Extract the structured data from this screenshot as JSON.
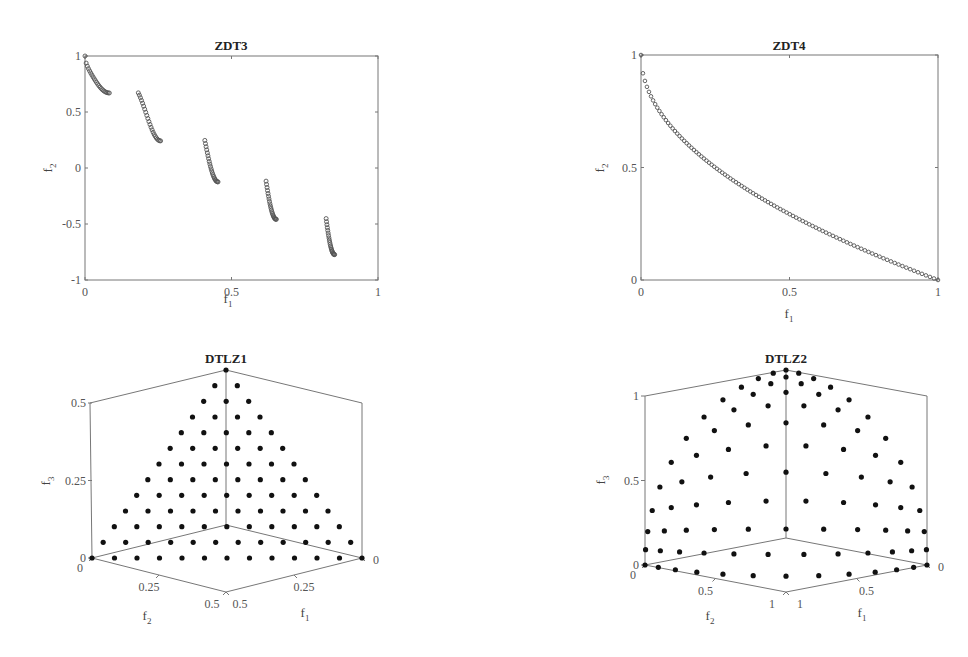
{
  "figure": {
    "width": 968,
    "height": 657,
    "marker_color": "#111111",
    "axis_color": "#777777"
  },
  "chart_data": [
    {
      "id": "zdt3",
      "type": "scatter",
      "title": "ZDT3",
      "xlabel": "f1",
      "ylabel": "f2",
      "xlim": [
        0,
        1
      ],
      "ylim": [
        -1,
        1
      ],
      "xticks": [
        "0",
        "0.5",
        "1"
      ],
      "yticks": [
        "-1",
        "-0.5",
        "0",
        "0.5",
        "1"
      ],
      "grid": false,
      "marker": "open-circle",
      "segments": [
        {
          "f1_range": [
            0.0,
            0.083
          ],
          "f2_range": [
            1.0,
            0.67
          ]
        },
        {
          "f1_range": [
            0.182,
            0.258
          ],
          "f2_range": [
            0.64,
            0.23
          ]
        },
        {
          "f1_range": [
            0.409,
            0.454
          ],
          "f2_range": [
            0.24,
            -0.13
          ]
        },
        {
          "f1_range": [
            0.618,
            0.653
          ],
          "f2_range": [
            -0.15,
            -0.46
          ]
        },
        {
          "f1_range": [
            0.823,
            0.852
          ],
          "f2_range": [
            -0.48,
            -0.77
          ]
        }
      ]
    },
    {
      "id": "zdt4",
      "type": "scatter",
      "title": "ZDT4",
      "xlabel": "f1",
      "ylabel": "f2",
      "xlim": [
        0,
        1
      ],
      "ylim": [
        0,
        1
      ],
      "xticks": [
        "0",
        "0.5",
        "1"
      ],
      "yticks": [
        "0",
        "0.5",
        "1"
      ],
      "grid": false,
      "marker": "open-circle",
      "curve": "f2 = 1 - sqrt(f1)",
      "n_points": 100
    },
    {
      "id": "dtlz1",
      "type": "scatter3d",
      "title": "DTLZ1",
      "xlabel": "f1",
      "ylabel": "f2",
      "zlabel": "f3",
      "xlim": [
        0,
        0.5
      ],
      "ylim": [
        0,
        0.5
      ],
      "zlim": [
        0,
        0.5
      ],
      "xticks": [
        "0",
        "0.25",
        "0.5"
      ],
      "yticks": [
        "0",
        "0.25",
        "0.5"
      ],
      "zticks": [
        "0",
        "0.25",
        "0.5"
      ],
      "surface": "f1 + f2 + f3 = 0.5",
      "divisions": 12,
      "marker": "filled-circle"
    },
    {
      "id": "dtlz2",
      "type": "scatter3d",
      "title": "DTLZ2",
      "xlabel": "f1",
      "ylabel": "f2",
      "zlabel": "f3",
      "xlim": [
        0,
        1
      ],
      "ylim": [
        0,
        1
      ],
      "zlim": [
        0,
        1
      ],
      "xticks": [
        "0",
        "0.5",
        "1"
      ],
      "yticks": [
        "0",
        "0.5",
        "1"
      ],
      "zticks": [
        "0",
        "0.5",
        "1"
      ],
      "surface": "f1^2 + f2^2 + f3^2 = 1",
      "divisions": 12,
      "marker": "filled-circle"
    }
  ]
}
